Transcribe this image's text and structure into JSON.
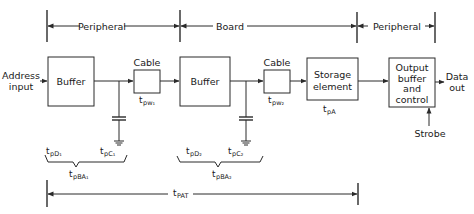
{
  "diagram": {
    "regions": [
      {
        "label": "Peripheral",
        "from_x": 47,
        "to_x": 180
      },
      {
        "label": "Board",
        "from_x": 180,
        "to_x": 357
      },
      {
        "label": "Peripheral",
        "from_x": 357,
        "to_x": 435
      }
    ],
    "inputs": {
      "address_line1": "Address",
      "address_line2": "input",
      "strobe": "Strobe"
    },
    "outputs": {
      "data_line1": "Data",
      "data_line2": "out"
    },
    "blocks": {
      "buffer1": "Buffer",
      "cable1": "Cable",
      "buffer2": "Buffer",
      "cable2": "Cable",
      "storage_line1": "Storage",
      "storage_line2": "element",
      "output_line1": "Output",
      "output_line2": "buffer",
      "output_line3": "and",
      "output_line4": "control"
    },
    "timing": {
      "t_pw1": {
        "base": "t",
        "sub": "pw₁"
      },
      "t_pw2": {
        "base": "t",
        "sub": "pw₂"
      },
      "t_pA": {
        "base": "t",
        "sub": "pA"
      },
      "t_pD1": {
        "base": "t",
        "sub": "pD₁"
      },
      "t_pC1": {
        "base": "t",
        "sub": "pC₁"
      },
      "t_pBA1": {
        "base": "t",
        "sub": "pBA₁"
      },
      "t_pD2": {
        "base": "t",
        "sub": "pD₂"
      },
      "t_pC2": {
        "base": "t",
        "sub": "pC₂"
      },
      "t_pBA2": {
        "base": "t",
        "sub": "pBA₂"
      },
      "t_PAT": {
        "base": "t",
        "sub": "PAT"
      }
    },
    "colors": {
      "ink": "#2a2a2a",
      "background": "#ffffff"
    }
  }
}
